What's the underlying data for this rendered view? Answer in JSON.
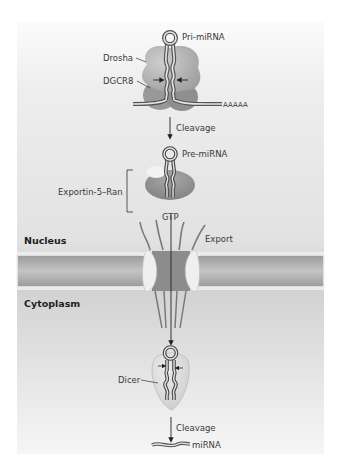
{
  "figure": {
    "compartments": {
      "nucleus": "Nucleus",
      "cytoplasm": "Cytoplasm"
    },
    "molecules": {
      "pri_mirna": "Pri-miRNA",
      "drosha": "Drosha",
      "dgcr8": "DGCR8",
      "poly_a_tail": "AAAAA",
      "pre_mirna": "Pre-miRNA",
      "exportin": "Exportin-5–Ran",
      "gtp": "GTP",
      "dicer": "Dicer",
      "mirna": "miRNA"
    },
    "steps": {
      "cleavage_1": "Cleavage",
      "export": "Export",
      "cleavage_2": "Cleavage"
    },
    "colors": {
      "background_top": "#f4f4f4",
      "background_bottom": "#dcdcdc",
      "protein_light": "#b8b8b8",
      "protein_dark": "#8e8e8e",
      "membrane": "#a8a8a8",
      "rna_stroke": "#555555",
      "rna_fill": "#e6e6e6",
      "pore_ring": "#ededed",
      "text": "#3a3a3a"
    }
  }
}
